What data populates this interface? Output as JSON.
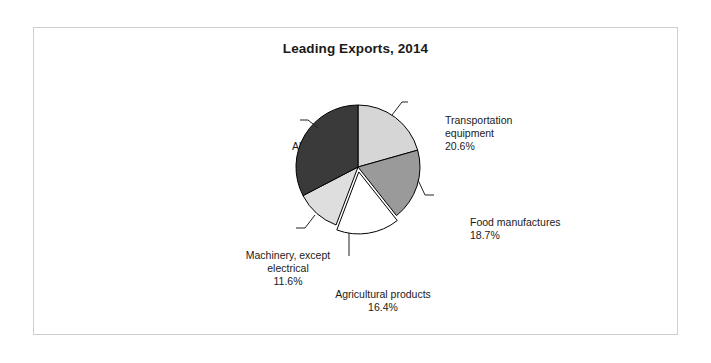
{
  "figure": {
    "title": "Leading Exports, 2014",
    "border_color": "#cfcfcf",
    "background_color": "#ffffff"
  },
  "chart_data": {
    "type": "pie",
    "title": "Leading Exports, 2014",
    "xlabel": "",
    "ylabel": "",
    "units": "percent",
    "start_angle_deg": 0,
    "direction": "clockwise",
    "legend": "none (direct labels with leader lines)",
    "grid": false,
    "categories": [
      "Transportation equipment",
      "Food manufactures",
      "Agricultural products",
      "Machinery, except electrical",
      "All others"
    ],
    "values": [
      20.6,
      18.7,
      16.4,
      11.6,
      32.6
    ],
    "value_labels": [
      "20.6%",
      "18.7%",
      "16.4%",
      "11.6%",
      "32.6%"
    ],
    "colors": [
      "#d6d6d6",
      "#9a9a9a",
      "#ffffff",
      "#dedede",
      "#3a3a3a"
    ],
    "exploded": [
      false,
      false,
      true,
      false,
      false
    ],
    "slices": [
      {
        "label": "Transportation equipment",
        "value": 20.6,
        "value_label": "20.6%",
        "color": "#d6d6d6",
        "label_line1": "Transportation",
        "label_line2": "equipment"
      },
      {
        "label": "Food manufactures",
        "value": 18.7,
        "value_label": "18.7%",
        "color": "#9a9a9a",
        "label_line1": "Food manufactures",
        "label_line2": ""
      },
      {
        "label": "Agricultural products",
        "value": 16.4,
        "value_label": "16.4%",
        "color": "#ffffff",
        "label_line1": "Agricultural products",
        "label_line2": ""
      },
      {
        "label": "Machinery, except electrical",
        "value": 11.6,
        "value_label": "11.6%",
        "color": "#dedede",
        "label_line1": "Machinery, except",
        "label_line2": "electrical"
      },
      {
        "label": "All others",
        "value": 32.6,
        "value_label": "32.6%",
        "color": "#3a3a3a",
        "label_line1": "All others",
        "label_line2": ""
      }
    ]
  }
}
